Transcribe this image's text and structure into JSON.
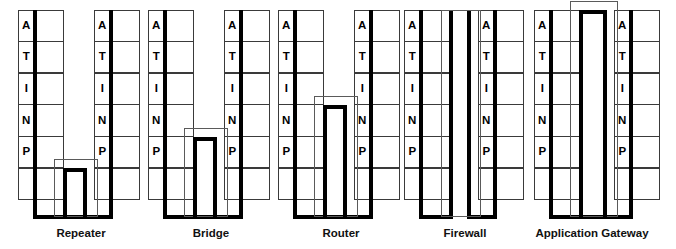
{
  "diagram": {
    "layer_labels": [
      "A",
      "T",
      "I",
      "N",
      "P"
    ],
    "layer_names": [
      "Application",
      "Transport",
      "Internet",
      "Network",
      "Physical"
    ],
    "blank_rows": 1,
    "rows_per_stack": 6,
    "line_color": "#000000",
    "grid_color": "#3a3a3a",
    "background": "#ffffff",
    "devices": [
      {
        "label": "Repeater",
        "connect_layer": "P",
        "connect_row_index": 4,
        "bump_top_row": 5,
        "style": "bump",
        "left_stack_x": 18,
        "right_stack_x": 94,
        "caption_x": 22,
        "caption_w": 118
      },
      {
        "label": "Bridge",
        "connect_layer": "N",
        "connect_row_index": 3,
        "bump_top_row": 4,
        "style": "bump",
        "left_stack_x": 148,
        "right_stack_x": 224,
        "caption_x": 152,
        "caption_w": 118
      },
      {
        "label": "Router",
        "connect_layer": "I",
        "connect_row_index": 2,
        "bump_top_row": 3,
        "style": "bump",
        "left_stack_x": 278,
        "right_stack_x": 354,
        "caption_x": 282,
        "caption_w": 118
      },
      {
        "label": "Firewall",
        "connect_layer": "none",
        "connect_row_index": -1,
        "bump_top_row": 0,
        "style": "parallel",
        "left_stack_x": 404,
        "right_stack_x": 478,
        "caption_x": 406,
        "caption_w": 118
      },
      {
        "label": "Application Gateway",
        "connect_layer": "A",
        "connect_row_index": 0,
        "bump_top_row": 0,
        "style": "bump",
        "left_stack_x": 534,
        "right_stack_x": 614,
        "caption_x": 508,
        "caption_w": 168
      }
    ]
  }
}
